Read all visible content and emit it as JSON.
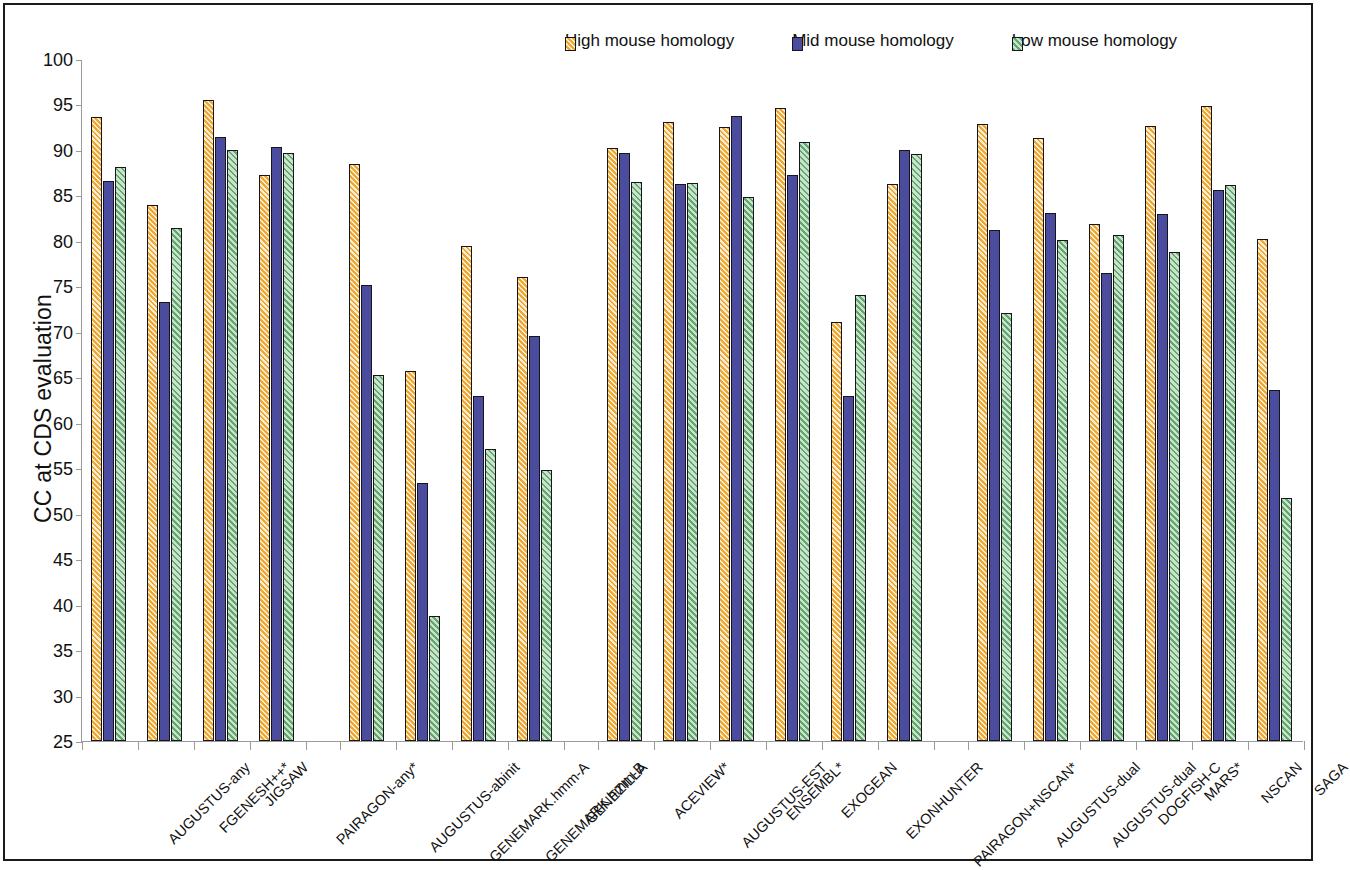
{
  "chart_data": {
    "type": "bar",
    "title": "",
    "xlabel": "",
    "ylabel": "CC at CDS evaluation",
    "ylim": [
      25,
      100
    ],
    "ytick_step": 5,
    "yticks": [
      100,
      95,
      90,
      85,
      80,
      75,
      70,
      65,
      60,
      55,
      50,
      45,
      40,
      35,
      30,
      25
    ],
    "grid": false,
    "legend_position": "top-right",
    "colors": {
      "high": "#F0A830",
      "mid": "#4B4C9D",
      "low": "#8FC79A",
      "bar_outline": "#15151c",
      "axis": "#9a9a9a",
      "frame": "#1a1a1a",
      "text": "#111111"
    },
    "legend": [
      {
        "label": "High mouse homology",
        "key": "high",
        "color": "#F0A830"
      },
      {
        "label": "Mid mouse homology",
        "key": "mid",
        "color": "#4B4C9D"
      },
      {
        "label": "Low mouse homology",
        "key": "low",
        "color": "#8FC79A"
      }
    ],
    "series": [
      {
        "name": "High mouse homology",
        "key": "high"
      },
      {
        "name": "Mid mouse homology",
        "key": "mid"
      },
      {
        "name": "Low mouse homology",
        "key": "low"
      }
    ],
    "groups": [
      {
        "name": "group-1",
        "categories": [
          "AUGUSTUS-any",
          "FGENESH++*",
          "JIGSAW",
          "PAIRAGON-any*"
        ],
        "values": {
          "high": [
            93.6,
            84.0,
            95.5,
            87.3
          ],
          "mid": [
            86.6,
            73.3,
            91.4,
            90.3
          ],
          "low": [
            88.1,
            81.4,
            90.0,
            89.7
          ]
        }
      },
      {
        "name": "group-2",
        "categories": [
          "AUGUSTUS-abinit",
          "GENEMARK.hmm-A",
          "GENEMARK.hmm-B",
          "GENEZILLA"
        ],
        "values": {
          "high": [
            88.5,
            65.7,
            79.4,
            76.0
          ],
          "mid": [
            75.1,
            53.4,
            62.9,
            69.5
          ],
          "low": [
            65.3,
            38.7,
            57.1,
            54.8
          ]
        }
      },
      {
        "name": "group-3",
        "categories": [
          "ACEVIEW*",
          "AUGUSTUS-EST",
          "ENSEMBL*",
          "EXOGEAN",
          "EXONHUNTER",
          "PAIRAGON+NSCAN*"
        ],
        "values": {
          "high": [
            90.2,
            93.1,
            92.5,
            94.6,
            71.1,
            86.3
          ],
          "mid": [
            89.7,
            86.3,
            93.7,
            87.2,
            62.9,
            90.0
          ],
          "low": [
            86.5,
            86.4,
            84.8,
            90.9,
            74.0,
            89.5
          ]
        }
      },
      {
        "name": "group-4",
        "categories": [
          "AUGUSTUS-dual",
          "AUGUSTUS-dual",
          "DOGFISH-C",
          "MARS*",
          "NSCAN",
          "SAGA"
        ],
        "values": {
          "high": [
            92.8,
            91.3,
            81.9,
            92.6,
            94.8,
            80.2
          ],
          "mid": [
            81.2,
            83.1,
            76.5,
            83.0,
            85.6,
            63.6
          ],
          "low": [
            72.1,
            80.1,
            80.7,
            78.8,
            86.1,
            51.7
          ]
        }
      }
    ]
  }
}
